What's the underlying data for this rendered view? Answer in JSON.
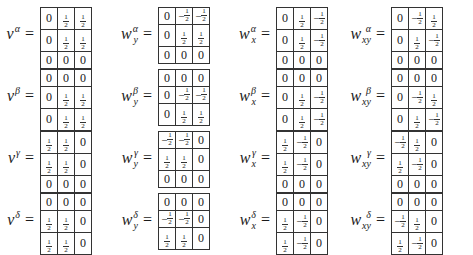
{
  "matrices": [
    {
      "id": "v-alpha",
      "base": "v",
      "sup": "α",
      "sub": "",
      "rows": [
        [
          "0",
          "1/2",
          "1/2"
        ],
        [
          "0",
          "1/2",
          "1/2"
        ],
        [
          "0",
          "0",
          "0"
        ]
      ]
    },
    {
      "id": "wy-alpha",
      "base": "w",
      "sup": "α",
      "sub": "y",
      "rows": [
        [
          "0",
          "-1/2",
          "-1/2"
        ],
        [
          "0",
          "1/2",
          "1/2"
        ],
        [
          "0",
          "0",
          "0"
        ]
      ]
    },
    {
      "id": "wx-alpha",
      "base": "w",
      "sup": "α",
      "sub": "x",
      "rows": [
        [
          "0",
          "1/2",
          "-1/2"
        ],
        [
          "0",
          "1/2",
          "-1/2"
        ],
        [
          "0",
          "0",
          "0"
        ]
      ]
    },
    {
      "id": "wxy-alpha",
      "base": "w",
      "sup": "α",
      "sub": "xy",
      "rows": [
        [
          "0",
          "-1/2",
          "1/2"
        ],
        [
          "0",
          "1/2",
          "-1/2"
        ],
        [
          "0",
          "0",
          "0"
        ]
      ]
    },
    {
      "id": "v-beta",
      "base": "v",
      "sup": "β",
      "sub": "",
      "rows": [
        [
          "0",
          "0",
          "0"
        ],
        [
          "0",
          "1/2",
          "1/2"
        ],
        [
          "0",
          "1/2",
          "1/2"
        ]
      ]
    },
    {
      "id": "wy-beta",
      "base": "w",
      "sup": "β",
      "sub": "y",
      "rows": [
        [
          "0",
          "0",
          "0"
        ],
        [
          "0",
          "-1/2",
          "-1/2"
        ],
        [
          "0",
          "1/2",
          "1/2"
        ]
      ]
    },
    {
      "id": "wx-beta",
      "base": "w",
      "sup": "β",
      "sub": "x",
      "rows": [
        [
          "0",
          "0",
          "0"
        ],
        [
          "0",
          "1/2",
          "-1/2"
        ],
        [
          "0",
          "1/2",
          "-1/2"
        ]
      ]
    },
    {
      "id": "wxy-beta",
      "base": "w",
      "sup": "β",
      "sub": "xy",
      "rows": [
        [
          "0",
          "0",
          "0"
        ],
        [
          "0",
          "-1/2",
          "1/2"
        ],
        [
          "0",
          "1/2",
          "-1/2"
        ]
      ]
    },
    {
      "id": "v-gamma",
      "base": "v",
      "sup": "γ",
      "sub": "",
      "rows": [
        [
          "1/2",
          "1/2",
          "0"
        ],
        [
          "1/2",
          "1/2",
          "0"
        ],
        [
          "0",
          "0",
          "0"
        ]
      ]
    },
    {
      "id": "wy-gamma",
      "base": "w",
      "sup": "γ",
      "sub": "y",
      "rows": [
        [
          "-1/2",
          "-1/2",
          "0"
        ],
        [
          "1/2",
          "1/2",
          "0"
        ],
        [
          "0",
          "0",
          "0"
        ]
      ]
    },
    {
      "id": "wx-gamma",
      "base": "w",
      "sup": "γ",
      "sub": "x",
      "rows": [
        [
          "1/2",
          "-1/2",
          "0"
        ],
        [
          "1/2",
          "-1/2",
          "0"
        ],
        [
          "0",
          "0",
          "0"
        ]
      ]
    },
    {
      "id": "wxy-gamma",
      "base": "w",
      "sup": "γ",
      "sub": "xy",
      "rows": [
        [
          "-1/2",
          "1/2",
          "0"
        ],
        [
          "1/2",
          "-1/2",
          "0"
        ],
        [
          "0",
          "0",
          "0"
        ]
      ]
    },
    {
      "id": "v-delta",
      "base": "v",
      "sup": "δ",
      "sub": "",
      "rows": [
        [
          "0",
          "0",
          "0"
        ],
        [
          "1/2",
          "1/2",
          "0"
        ],
        [
          "1/2",
          "1/2",
          "0"
        ]
      ]
    },
    {
      "id": "wy-delta",
      "base": "w",
      "sup": "δ",
      "sub": "y",
      "rows": [
        [
          "0",
          "0",
          "0"
        ],
        [
          "-1/2",
          "-1/2",
          "0"
        ],
        [
          "1/2",
          "1/2",
          "0"
        ]
      ]
    },
    {
      "id": "wx-delta",
      "base": "w",
      "sup": "δ",
      "sub": "x",
      "rows": [
        [
          "0",
          "0",
          "0"
        ],
        [
          "1/2",
          "-1/2",
          "0"
        ],
        [
          "1/2",
          "-1/2",
          "0"
        ]
      ]
    },
    {
      "id": "wxy-delta",
      "base": "w",
      "sup": "δ",
      "sub": "xy",
      "rows": [
        [
          "0",
          "0",
          "0"
        ],
        [
          "-1/2",
          "1/2",
          "0"
        ],
        [
          "1/2",
          "-1/2",
          "0"
        ]
      ]
    }
  ],
  "equals": "="
}
